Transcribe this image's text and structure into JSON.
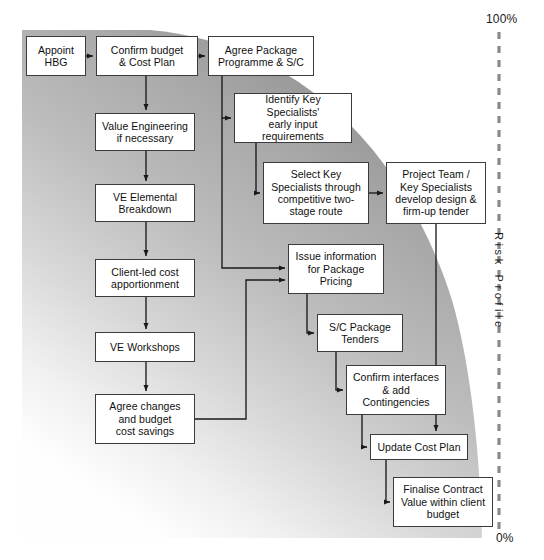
{
  "diagram": {
    "axis": {
      "top_label": "100%",
      "bottom_label": "0%",
      "vertical_label": "Risk Profile",
      "divider_style": "dashed"
    },
    "colors": {
      "node_fill": "#ffffff",
      "node_stroke": "#3b3b3b",
      "connector": "#1a1a1a",
      "risk_band_dark": "#9a9a9a",
      "risk_band_light": "#fdfdfd",
      "divider": "#8a8a8a",
      "text": "#101010"
    },
    "nodes": [
      {
        "id": "appoint-hbg",
        "label": "Appoint\nHBG",
        "x": 26,
        "y": 36,
        "w": 60,
        "h": 40
      },
      {
        "id": "confirm-budget",
        "label": "Confirm budget\n& Cost Plan",
        "x": 96,
        "y": 36,
        "w": 102,
        "h": 40
      },
      {
        "id": "agree-package",
        "label": "Agree Package\nProgramme & S/C",
        "x": 208,
        "y": 36,
        "w": 106,
        "h": 40
      },
      {
        "id": "value-engineering",
        "label": "Value Engineering\nif necessary",
        "x": 95,
        "y": 113,
        "w": 100,
        "h": 38
      },
      {
        "id": "identify-specialists",
        "label": "Identify Key Specialists'\nearly input\nrequirements",
        "x": 234,
        "y": 93,
        "w": 118,
        "h": 50
      },
      {
        "id": "ve-elemental",
        "label": "VE Elemental\nBreakdown",
        "x": 95,
        "y": 184,
        "w": 100,
        "h": 38
      },
      {
        "id": "select-specialists",
        "label": "Select Key\nSpecialists through\ncompetitive two-\nstage route",
        "x": 263,
        "y": 162,
        "w": 106,
        "h": 62
      },
      {
        "id": "project-team",
        "label": "Project Team /\nKey Specialists\ndevelop design &\nfirm-up tender",
        "x": 386,
        "y": 162,
        "w": 100,
        "h": 62
      },
      {
        "id": "client-led-cost",
        "label": "Client-led cost\napportionment",
        "x": 95,
        "y": 259,
        "w": 100,
        "h": 38
      },
      {
        "id": "issue-information",
        "label": "Issue information\nfor Package\nPricing",
        "x": 288,
        "y": 244,
        "w": 96,
        "h": 50
      },
      {
        "id": "ve-workshops",
        "label": "VE Workshops",
        "x": 95,
        "y": 332,
        "w": 100,
        "h": 30
      },
      {
        "id": "sc-package-tenders",
        "label": "S/C Package\nTenders",
        "x": 317,
        "y": 314,
        "w": 86,
        "h": 38
      },
      {
        "id": "agree-changes",
        "label": "Agree changes\nand budget\ncost savings",
        "x": 95,
        "y": 394,
        "w": 100,
        "h": 50
      },
      {
        "id": "confirm-interfaces",
        "label": "Confirm interfaces\n& add\nContingencies",
        "x": 346,
        "y": 365,
        "w": 100,
        "h": 50
      },
      {
        "id": "update-cost-plan",
        "label": "Update Cost Plan",
        "x": 370,
        "y": 434,
        "w": 98,
        "h": 26
      },
      {
        "id": "finalise-contract",
        "label": "Finalise Contract\nValue within client\nbudget",
        "x": 393,
        "y": 477,
        "w": 100,
        "h": 50
      }
    ]
  }
}
